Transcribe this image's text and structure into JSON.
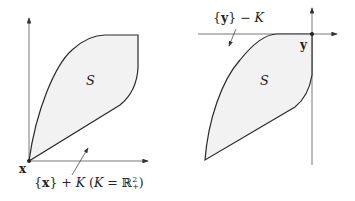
{
  "left_panel": {
    "set_label": "S",
    "point_label": "x",
    "cone_label": "{x} + K (K = ℝ²₊)",
    "cone_label_parts": {
      "open": "{",
      "point": "x",
      "close": "} + ",
      "K": "K",
      "paren": " (",
      "K2": "K",
      "eq": " = ℝ",
      "sup": "2",
      "sub": "+",
      "end": ")"
    }
  },
  "right_panel": {
    "set_label": "S",
    "point_label": "y",
    "cone_label_parts": {
      "open": "{",
      "point": "y",
      "close": "} − ",
      "K": "K"
    }
  },
  "colors": {
    "fill": "#f2f2f2",
    "stroke": "#2a2a2a",
    "axis": "#555555"
  }
}
